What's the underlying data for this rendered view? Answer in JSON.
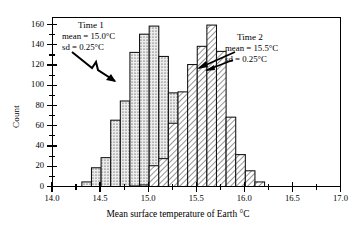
{
  "chart_data": {
    "type": "bar",
    "subtype": "overlaid-histogram",
    "title": "",
    "xlabel": "Mean surface temperature of Earth °C",
    "ylabel": "Count",
    "xlim": [
      14.0,
      17.0
    ],
    "ylim": [
      0,
      168
    ],
    "bin_width": 0.1,
    "grid": false,
    "legend": "none",
    "xticks": [
      "14.0",
      "14.5",
      "15.0",
      "15.5",
      "16.0",
      "16.5",
      "17.0"
    ],
    "xtick_values": [
      14.0,
      14.5,
      15.0,
      15.5,
      16.0,
      16.5,
      17.0
    ],
    "yticks": [
      "0",
      "20",
      "40",
      "60",
      "80",
      "100",
      "120",
      "140",
      "160"
    ],
    "ytick_values": [
      0,
      20,
      40,
      60,
      80,
      100,
      120,
      140,
      160
    ],
    "y_minor_ticks": [
      10,
      30,
      50,
      70,
      90,
      110,
      130,
      150
    ],
    "x_minor_ticks": [
      14.25,
      14.75,
      15.25,
      15.75,
      16.25,
      16.75
    ],
    "series": [
      {
        "name": "Time 1",
        "fill": "dotted",
        "mean": 15.0,
        "sd": 0.25,
        "bin_starts": [
          14.3,
          14.4,
          14.5,
          14.6,
          14.7,
          14.8,
          14.9,
          15.0,
          15.1,
          15.2,
          15.3,
          15.4,
          15.5,
          15.6
        ],
        "values": [
          6,
          20,
          30,
          67,
          86,
          134,
          152,
          160,
          130,
          94,
          63,
          29,
          11,
          3
        ]
      },
      {
        "name": "Time 2",
        "fill": "hatched",
        "mean": 15.5,
        "sd": 0.25,
        "bin_starts": [
          14.8,
          14.9,
          15.0,
          15.1,
          15.2,
          15.3,
          15.4,
          15.5,
          15.6,
          15.7,
          15.8,
          15.9,
          16.0,
          16.1
        ],
        "values": [
          2,
          3,
          22,
          29,
          64,
          95,
          122,
          140,
          161,
          135,
          70,
          33,
          17,
          6
        ]
      }
    ],
    "annotations": [
      {
        "name": "Time 1",
        "header": "Time 1",
        "line1": "mean = 15.0°C",
        "line2": "sd  = 0.25°C",
        "arrow": "points down-right toward Time 1 distribution"
      },
      {
        "name": "Time 2",
        "header": "Time 2",
        "line1": "mean = 15.5°C",
        "line2": "sd  = 0.25°C",
        "arrow": "points left toward Time 2 distribution"
      }
    ]
  },
  "colors": {
    "axis": "#000000",
    "bar_outline": "#111111",
    "bar_fill_time1": "#e8e8e8",
    "bar_fill_time2": "#ffffff",
    "background": "#ffffff"
  }
}
